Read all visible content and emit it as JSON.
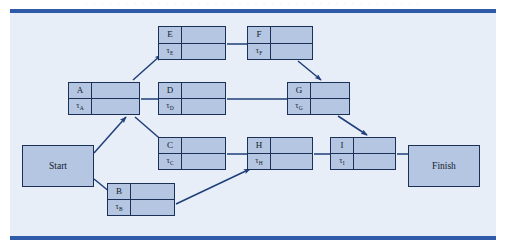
{
  "page": {
    "header_faint_text": "· · · · · · · · · · · · · · · · · · · · · · · · · · · · · · · · · · · · · · · · · ·",
    "width": 506,
    "height": 249
  },
  "figure": {
    "type": "project-network-diagram",
    "canvas": {
      "x": 10,
      "y": 13,
      "width": 486,
      "height": 223,
      "background": "#e8eef7"
    },
    "rules": {
      "color": "#2f5aa8",
      "top_y": 9,
      "bottom_y": 236,
      "thickness": 4
    },
    "colors": {
      "box_fill": "#b4c6e2",
      "box_border": "#1b3056",
      "arrow": "#1f3f7a",
      "text": "#121a2c",
      "canvas_background": "#e8eef7",
      "rule_blue": "#2f5aa8"
    }
  },
  "terminals": [
    {
      "id": "start",
      "label": "Start",
      "x": 12,
      "y": 132,
      "w": 72,
      "h": 42
    },
    {
      "id": "finish",
      "label": "Finish",
      "x": 398,
      "y": 132,
      "w": 72,
      "h": 42
    }
  ],
  "tasks": [
    {
      "id": "E",
      "label": "E",
      "duration_symbol": "τ",
      "duration_subscript": "E",
      "x": 148,
      "y": 13,
      "w": 68,
      "h": 34
    },
    {
      "id": "F",
      "label": "F",
      "duration_symbol": "τ",
      "duration_subscript": "F",
      "x": 237,
      "y": 13,
      "w": 66,
      "h": 34
    },
    {
      "id": "A",
      "label": "A",
      "duration_symbol": "τ",
      "duration_subscript": "A",
      "x": 58,
      "y": 69,
      "w": 72,
      "h": 33
    },
    {
      "id": "D",
      "label": "D",
      "duration_symbol": "τ",
      "duration_subscript": "D",
      "x": 148,
      "y": 69,
      "w": 68,
      "h": 33
    },
    {
      "id": "G",
      "label": "G",
      "duration_symbol": "τ",
      "duration_subscript": "G",
      "x": 277,
      "y": 69,
      "w": 63,
      "h": 33
    },
    {
      "id": "C",
      "label": "C",
      "duration_symbol": "τ",
      "duration_subscript": "C",
      "x": 148,
      "y": 124,
      "w": 68,
      "h": 33
    },
    {
      "id": "H",
      "label": "H",
      "duration_symbol": "τ",
      "duration_subscript": "H",
      "x": 237,
      "y": 124,
      "w": 66,
      "h": 33
    },
    {
      "id": "I",
      "label": "I",
      "duration_symbol": "τ",
      "duration_subscript": "I",
      "x": 320,
      "y": 124,
      "w": 66,
      "h": 33
    },
    {
      "id": "B",
      "label": "B",
      "duration_symbol": "τ",
      "duration_subscript": "B",
      "x": 97,
      "y": 170,
      "w": 68,
      "h": 33
    }
  ],
  "edges": [
    {
      "id": "start-to-a",
      "from": "Start",
      "to": "A",
      "path": "M84,140 L116,104"
    },
    {
      "id": "start-to-b",
      "from": "Start",
      "to": "B",
      "path": "M84,166 L111,188"
    },
    {
      "id": "a-to-e",
      "from": "A",
      "to": "E",
      "path": "M123,67 L151,42"
    },
    {
      "id": "a-to-d",
      "from": "A",
      "to": "D",
      "path": "M131,86 L215,86"
    },
    {
      "id": "a-to-c",
      "from": "A",
      "to": "C",
      "path": "M125,104 L155,130"
    },
    {
      "id": "e-to-f",
      "from": "E",
      "to": "F",
      "path": "M217,31 L276,31"
    },
    {
      "id": "f-to-g",
      "from": "F",
      "to": "G",
      "path": "M288,48 L311,67"
    },
    {
      "id": "d-to-g",
      "from": "D",
      "to": "G",
      "path": "M217,86 L340,86"
    },
    {
      "id": "g-to-i",
      "from": "G",
      "to": "I",
      "path": "M328,103 L357,122"
    },
    {
      "id": "c-to-h",
      "from": "C",
      "to": "H",
      "path": "M217,141 L276,141"
    },
    {
      "id": "b-to-h",
      "from": "B",
      "to": "H",
      "path": "M166,191 L240,156"
    },
    {
      "id": "h-to-i",
      "from": "H",
      "to": "I",
      "path": "M304,141 L359,141"
    },
    {
      "id": "i-to-finish",
      "from": "I",
      "to": "Finish",
      "path": "M387,141 L437,141"
    }
  ]
}
